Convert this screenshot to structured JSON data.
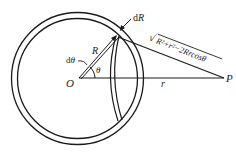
{
  "diagram": {
    "colors": {
      "stroke": "#1a1a1a",
      "background": "#ffffff"
    },
    "labels": {
      "center": "O",
      "point": "P",
      "radius": "R",
      "shell_thickness_d": "d",
      "shell_thickness_var": "R",
      "angle": "θ",
      "angle_increment_d": "d",
      "angle_increment_var": "θ",
      "distance": "r",
      "slant_distance": "R²+r²−2Rrcosθ",
      "sqrt_symbol": "√"
    }
  }
}
